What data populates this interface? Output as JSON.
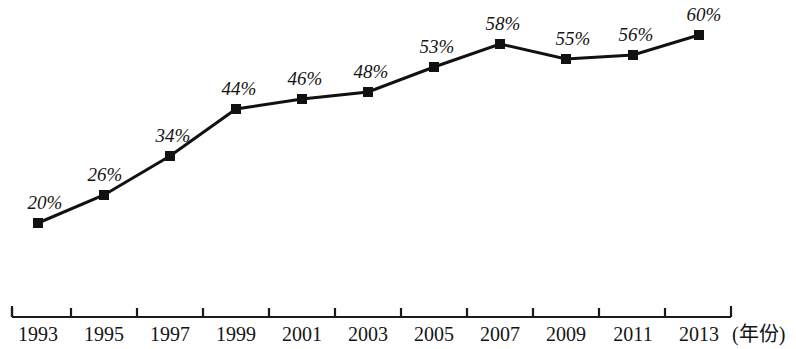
{
  "chart_data": {
    "type": "line",
    "title": "",
    "subtitle": "",
    "xlabel": "(年份)",
    "ylabel": "",
    "grid": false,
    "legend": null,
    "axis": {
      "x_axis_visible": true,
      "y_axis_visible": false,
      "x_tick_count": 11,
      "xlim": [
        "1993",
        "2013"
      ],
      "ylim": [
        0,
        70
      ]
    },
    "marker": {
      "shape": "square",
      "size_px": 10,
      "color": "#111111"
    },
    "line": {
      "color": "#111111",
      "width_px": 3,
      "style": "solid"
    },
    "categories": [
      "1993",
      "1995",
      "1997",
      "1999",
      "2001",
      "2003",
      "2005",
      "2007",
      "2009",
      "2011",
      "2013"
    ],
    "values": [
      20,
      26,
      34,
      44,
      46,
      48,
      53,
      58,
      55,
      56,
      60
    ],
    "data_labels": [
      "20%",
      "26%",
      "34%",
      "44%",
      "46%",
      "48%",
      "53%",
      "58%",
      "55%",
      "56%",
      "60%"
    ],
    "points": [
      {
        "category": "1993",
        "value": 20,
        "label": "20%",
        "px": 38,
        "py": 223,
        "lx": 45,
        "ly": 212
      },
      {
        "category": "1995",
        "value": 26,
        "label": "26%",
        "px": 104,
        "py": 195,
        "lx": 105,
        "ly": 184
      },
      {
        "category": "1997",
        "value": 34,
        "label": "34%",
        "px": 170,
        "py": 156,
        "lx": 173,
        "ly": 145
      },
      {
        "category": "1999",
        "value": 44,
        "label": "44%",
        "px": 236,
        "py": 109,
        "lx": 239,
        "ly": 98
      },
      {
        "category": "2001",
        "value": 46,
        "label": "46%",
        "px": 302,
        "py": 99,
        "lx": 305,
        "ly": 88
      },
      {
        "category": "2003",
        "value": 48,
        "label": "48%",
        "px": 368,
        "py": 92,
        "lx": 371,
        "ly": 81
      },
      {
        "category": "2005",
        "value": 53,
        "label": "53%",
        "px": 434,
        "py": 67,
        "lx": 437,
        "ly": 56
      },
      {
        "category": "2007",
        "value": 58,
        "label": "58%",
        "px": 500,
        "py": 44,
        "lx": 503,
        "ly": 33
      },
      {
        "category": "2009",
        "value": 55,
        "label": "55%",
        "px": 566,
        "py": 59,
        "lx": 573,
        "ly": 48
      },
      {
        "category": "2011",
        "value": 56,
        "label": "56%",
        "px": 633,
        "py": 55,
        "lx": 636,
        "ly": 44
      },
      {
        "category": "2013",
        "value": 60,
        "label": "60%",
        "px": 699,
        "py": 35,
        "lx": 704,
        "ly": 24
      }
    ],
    "x_ticks": [
      {
        "label": "1993",
        "px": 38,
        "tick_px": 12
      },
      {
        "label": "1995",
        "px": 104,
        "tick_px": 71
      },
      {
        "label": "1997",
        "px": 170,
        "tick_px": 137
      },
      {
        "label": "1999",
        "px": 236,
        "tick_px": 203
      },
      {
        "label": "2001",
        "px": 302,
        "tick_px": 269
      },
      {
        "label": "2003",
        "px": 368,
        "tick_px": 335
      },
      {
        "label": "2005",
        "px": 434,
        "tick_px": 401
      },
      {
        "label": "2007",
        "px": 500,
        "tick_px": 467
      },
      {
        "label": "2009",
        "px": 566,
        "tick_px": 533
      },
      {
        "label": "2011",
        "px": 633,
        "tick_px": 599
      },
      {
        "label": "2013",
        "px": 699,
        "tick_px": 665
      }
    ],
    "x_axis_caption_px": 731
  }
}
